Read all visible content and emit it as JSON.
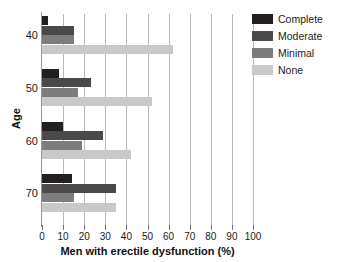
{
  "chart_data": {
    "type": "bar",
    "orientation": "horizontal",
    "title": "",
    "xlabel": "Men with erectile dysfunction (%)",
    "ylabel": "Age",
    "categories": [
      "40",
      "50",
      "60",
      "70"
    ],
    "xlim": [
      0,
      100
    ],
    "xticks": [
      0,
      10,
      20,
      30,
      40,
      50,
      60,
      70,
      80,
      90,
      100
    ],
    "grid": "vertical",
    "legend_position": "right",
    "series": [
      {
        "name": "Complete",
        "color": "#231f20",
        "values": [
          3,
          8,
          10,
          14
        ]
      },
      {
        "name": "Moderate",
        "color": "#4a4a4a",
        "values": [
          15,
          23,
          29,
          35
        ]
      },
      {
        "name": "Minimal",
        "color": "#7d7d7d",
        "values": [
          15,
          17,
          19,
          15
        ]
      },
      {
        "name": "None",
        "color": "#c9c9c9",
        "values": [
          62,
          52,
          42,
          35
        ]
      }
    ]
  },
  "axes": {
    "x_title": "Men with erectile dysfunction (%)",
    "y_title": "Age",
    "x_tick_labels": [
      "0",
      "10",
      "20",
      "30",
      "40",
      "50",
      "60",
      "70",
      "80",
      "90",
      "100"
    ],
    "y_tick_labels": [
      "40",
      "50",
      "60",
      "70"
    ]
  },
  "legend": {
    "items": [
      {
        "label": "Complete",
        "color": "#231f20"
      },
      {
        "label": "Moderate",
        "color": "#4a4a4a"
      },
      {
        "label": "Minimal",
        "color": "#7d7d7d"
      },
      {
        "label": "None",
        "color": "#c9c9c9"
      }
    ]
  }
}
